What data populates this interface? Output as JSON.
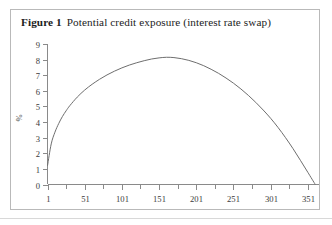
{
  "figure": {
    "label": "Figure 1",
    "caption": "Potential credit exposure (interest rate swap)"
  },
  "chart_data": {
    "type": "line",
    "title": "Potential credit exposure (interest rate swap)",
    "xlabel": "",
    "ylabel": "%",
    "xlim": [
      1,
      366
    ],
    "ylim": [
      0,
      9
    ],
    "grid": false,
    "legend": null,
    "xticks": [
      1,
      51,
      101,
      151,
      201,
      251,
      301,
      351
    ],
    "xtick_labels": [
      "1",
      "51",
      "101",
      "151",
      "201",
      "251",
      "301",
      "351"
    ],
    "minor_xticks": [
      26,
      76,
      126,
      176,
      226,
      276,
      326
    ],
    "yticks": [
      0,
      1,
      2,
      3,
      4,
      5,
      6,
      7,
      8,
      9
    ],
    "ytick_labels": [
      "0",
      "1",
      "2",
      "3",
      "4",
      "5",
      "6",
      "7",
      "8",
      "9"
    ],
    "series": [
      {
        "name": "Potential credit exposure",
        "color": "#6e6e6e",
        "x": [
          1,
          6,
          11,
          16,
          21,
          26,
          31,
          41,
          51,
          61,
          71,
          81,
          91,
          101,
          111,
          121,
          131,
          141,
          151,
          161,
          171,
          181,
          191,
          201,
          211,
          221,
          231,
          241,
          251,
          261,
          271,
          281,
          291,
          301,
          311,
          321,
          331,
          341,
          351,
          361
        ],
        "y": [
          1.2,
          2.6,
          3.35,
          3.9,
          4.35,
          4.72,
          5.05,
          5.6,
          6.05,
          6.42,
          6.74,
          7.02,
          7.26,
          7.47,
          7.65,
          7.8,
          7.93,
          8.04,
          8.11,
          8.15,
          8.13,
          8.06,
          7.95,
          7.8,
          7.61,
          7.38,
          7.12,
          6.82,
          6.49,
          6.12,
          5.71,
          5.26,
          4.77,
          4.24,
          3.65,
          3.0,
          2.3,
          1.55,
          0.78,
          0.0
        ]
      }
    ],
    "peak": {
      "x": 161,
      "y": 8.15
    },
    "start": {
      "x": 1,
      "y": 1.2
    },
    "end": {
      "x": 361,
      "y": 0.0
    }
  },
  "colors": {
    "frame_border": "#b9b9b9",
    "axis": "#8a8a8a",
    "curve": "#6e6e6e",
    "text": "#1c1c1c",
    "tick_text": "#3a3a3a",
    "rule": "#d8d8d8",
    "background": "#ffffff"
  }
}
